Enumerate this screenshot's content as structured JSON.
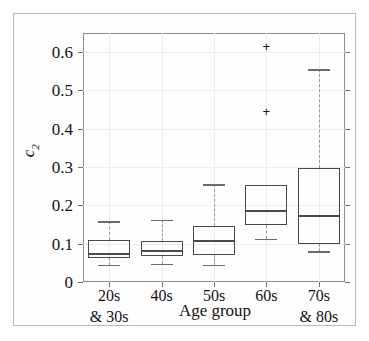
{
  "chart_data": {
    "type": "box",
    "title": "",
    "xlabel": "Age group",
    "ylabel": "c2",
    "ylabel_base": "c",
    "ylabel_sub": "2",
    "ylim": [
      0,
      0.65
    ],
    "yticks": [
      0,
      0.1,
      0.2,
      0.3,
      0.4,
      0.5,
      0.6
    ],
    "ytick_labels": [
      "0",
      "0.1",
      "0.2",
      "0.3",
      "0.4",
      "0.5",
      "0.6"
    ],
    "grid": true,
    "legend": null,
    "categories": [
      "20s & 30s",
      "40s",
      "50s",
      "60s",
      "70s & 80s"
    ],
    "xtick_labels": [
      {
        "line1": "20s",
        "line2": "& 30s"
      },
      {
        "line1": "40s",
        "line2": ""
      },
      {
        "line1": "50s",
        "line2": ""
      },
      {
        "line1": "60s",
        "line2": ""
      },
      {
        "line1": "70s",
        "line2": "& 80s"
      }
    ],
    "boxes": [
      {
        "category": "20s & 30s",
        "whisker_low": 0.045,
        "q1": 0.062,
        "median": 0.073,
        "q3": 0.11,
        "whisker_high": 0.158,
        "outliers": []
      },
      {
        "category": "40s",
        "whisker_low": 0.048,
        "q1": 0.068,
        "median": 0.08,
        "q3": 0.108,
        "whisker_high": 0.163,
        "outliers": []
      },
      {
        "category": "50s",
        "whisker_low": 0.045,
        "q1": 0.07,
        "median": 0.107,
        "q3": 0.146,
        "whisker_high": 0.255,
        "outliers": []
      },
      {
        "category": "60s",
        "whisker_low": 0.112,
        "q1": 0.15,
        "median": 0.185,
        "q3": 0.253,
        "whisker_high": 0.253,
        "outliers": [
          0.445,
          0.615
        ]
      },
      {
        "category": "70s & 80s",
        "whisker_low": 0.08,
        "q1": 0.1,
        "median": 0.171,
        "q3": 0.298,
        "whisker_high": 0.555,
        "outliers": []
      }
    ],
    "colors": {
      "box_edge": "#4a4a4a",
      "median": "#4a4a4a",
      "whisker": "#9a9a9a",
      "outlier": "#111111",
      "grid": "#ededed",
      "axis": "#8d8d8d",
      "background": "#ffffff"
    }
  }
}
